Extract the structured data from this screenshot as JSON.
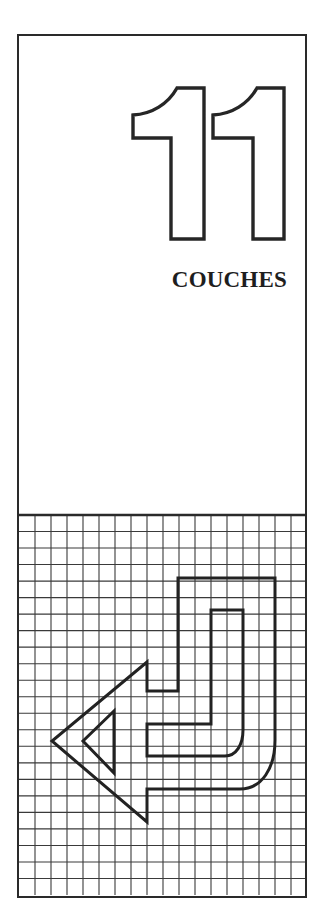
{
  "page": {
    "chapter_number": "11",
    "chapter_title": "COUCHES"
  },
  "colors": {
    "ink": "#2a2a2a",
    "grid": "#3a3a3a",
    "paper": "#ffffff"
  },
  "grid": {
    "columns": 18,
    "rows": 23
  },
  "icons": {
    "chapter_number_glyph": "outlined-digits-11",
    "arrow": "return-arrow-left-outline"
  }
}
